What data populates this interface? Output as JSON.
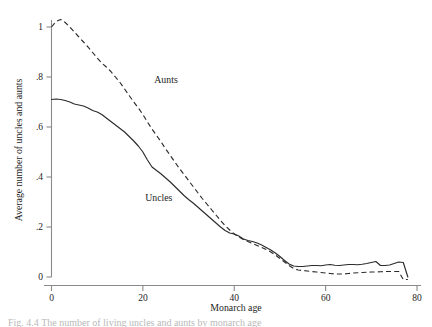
{
  "figure": {
    "caption": "Fig. 4.4  The number of living uncles and aunts by monarch age"
  },
  "chart_data": {
    "type": "line",
    "title": "",
    "xlabel": "Monarch age",
    "ylabel": "Average number of uncles and aunts",
    "xlim": [
      0,
      80
    ],
    "ylim": [
      0,
      1.08
    ],
    "xticks": [
      0,
      20,
      40,
      60,
      80
    ],
    "xtick_labels": [
      "0",
      "20",
      "40",
      "60",
      "80"
    ],
    "yticks": [
      0,
      0.2,
      0.4,
      0.6,
      0.8,
      1.0
    ],
    "ytick_labels": [
      "0",
      ".2",
      ".4",
      ".6",
      ".8",
      "1"
    ],
    "grid": false,
    "legend": "inline-annotations",
    "annotations": [
      {
        "text": "Aunts",
        "x": 22.5,
        "y": 0.775
      },
      {
        "text": "Uncles",
        "x": 20.5,
        "y": 0.305
      }
    ],
    "x": [
      0,
      1,
      2,
      3,
      4,
      5,
      6,
      7,
      8,
      9,
      10,
      11,
      12,
      13,
      14,
      15,
      16,
      17,
      18,
      19,
      20,
      21,
      22,
      23,
      24,
      25,
      26,
      27,
      28,
      29,
      30,
      31,
      32,
      33,
      34,
      35,
      36,
      37,
      38,
      39,
      40,
      41,
      42,
      43,
      44,
      45,
      46,
      47,
      48,
      49,
      50,
      51,
      52,
      53,
      54,
      55,
      56,
      57,
      58,
      59,
      60,
      61,
      62,
      63,
      64,
      65,
      66,
      67,
      68,
      69,
      70,
      71,
      72,
      73,
      74,
      75,
      76,
      77,
      78
    ],
    "series": [
      {
        "name": "Aunts",
        "style": "dashed",
        "values": [
          1.0,
          1.022,
          1.03,
          1.018,
          1.0,
          0.98,
          0.96,
          0.94,
          0.92,
          0.898,
          0.876,
          0.856,
          0.84,
          0.822,
          0.8,
          0.778,
          0.752,
          0.726,
          0.7,
          0.676,
          0.65,
          0.62,
          0.592,
          0.566,
          0.54,
          0.512,
          0.486,
          0.46,
          0.434,
          0.41,
          0.386,
          0.362,
          0.338,
          0.314,
          0.292,
          0.27,
          0.248,
          0.226,
          0.206,
          0.188,
          0.172,
          0.16,
          0.15,
          0.142,
          0.134,
          0.126,
          0.118,
          0.11,
          0.1,
          0.088,
          0.074,
          0.06,
          0.046,
          0.034,
          0.028,
          0.026,
          0.024,
          0.022,
          0.02,
          0.018,
          0.016,
          0.014,
          0.012,
          0.012,
          0.012,
          0.014,
          0.016,
          0.017,
          0.018,
          0.019,
          0.02,
          0.02,
          0.021,
          0.022,
          0.022,
          0.022,
          0.022,
          -0.01,
          -0.01
        ]
      },
      {
        "name": "Uncles",
        "style": "solid",
        "values": [
          0.71,
          0.712,
          0.71,
          0.706,
          0.7,
          0.692,
          0.688,
          0.684,
          0.676,
          0.666,
          0.66,
          0.65,
          0.636,
          0.622,
          0.608,
          0.594,
          0.58,
          0.562,
          0.544,
          0.524,
          0.5,
          0.468,
          0.44,
          0.426,
          0.412,
          0.396,
          0.38,
          0.362,
          0.344,
          0.326,
          0.31,
          0.296,
          0.28,
          0.264,
          0.248,
          0.232,
          0.216,
          0.2,
          0.186,
          0.176,
          0.172,
          0.164,
          0.152,
          0.146,
          0.142,
          0.136,
          0.128,
          0.118,
          0.108,
          0.096,
          0.082,
          0.066,
          0.052,
          0.044,
          0.042,
          0.042,
          0.044,
          0.046,
          0.046,
          0.045,
          0.048,
          0.05,
          0.047,
          0.046,
          0.048,
          0.05,
          0.05,
          0.049,
          0.051,
          0.054,
          0.058,
          0.062,
          0.046,
          0.046,
          0.048,
          0.054,
          0.06,
          0.058,
          0.0
        ]
      }
    ]
  }
}
